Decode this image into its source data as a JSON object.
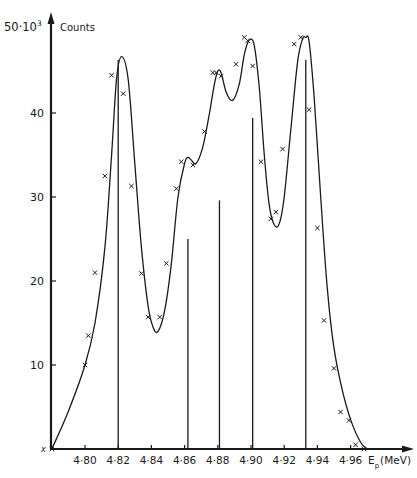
{
  "chart_data": {
    "type": "line",
    "title": "",
    "xlabel": "E_p (MeV)",
    "ylabel": "Counts",
    "y_unit_label": "50·10³",
    "xlim": [
      4.78,
      4.975
    ],
    "ylim": [
      0,
      50
    ],
    "x_ticks": [
      4.8,
      4.82,
      4.84,
      4.86,
      4.88,
      4.9,
      4.92,
      4.94,
      4.96
    ],
    "x_tick_labels": [
      "4·80",
      "4·82",
      "4·84",
      "4·86",
      "4·88",
      "4·90",
      "4·92",
      "4·94",
      "4·96"
    ],
    "y_ticks": [
      10,
      20,
      30,
      40
    ],
    "y_tick_labels": [
      "10",
      "20",
      "30",
      "40"
    ],
    "grid": false,
    "series": [
      {
        "name": "fitted curve",
        "style": "smooth line",
        "x": [
          4.78,
          4.79,
          4.8,
          4.806,
          4.812,
          4.816,
          4.819,
          4.822,
          4.826,
          4.83,
          4.834,
          4.838,
          4.841,
          4.844,
          4.848,
          4.852,
          4.856,
          4.86,
          4.862,
          4.864,
          4.867,
          4.871,
          4.875,
          4.878,
          4.88,
          4.882,
          4.885,
          4.889,
          4.893,
          4.896,
          4.899,
          4.902,
          4.905,
          4.908,
          4.911,
          4.914,
          4.917,
          4.92,
          4.924,
          4.928,
          4.931,
          4.933,
          4.935,
          4.938,
          4.942,
          4.946,
          4.95,
          4.955,
          4.96,
          4.966,
          4.97
        ],
        "y": [
          0,
          4.5,
          10,
          15,
          24,
          35,
          44,
          46.7,
          44,
          34,
          24,
          17,
          14.5,
          14,
          16.5,
          22,
          30,
          34,
          34.7,
          34.4,
          34,
          36,
          40,
          43.5,
          45,
          44.8,
          42.5,
          41.5,
          43.5,
          47,
          48.7,
          48,
          43,
          35,
          29,
          26.7,
          26.8,
          30,
          38,
          46,
          48.8,
          49,
          48.5,
          42,
          30,
          19,
          12,
          7,
          3.5,
          0.8,
          0
        ]
      },
      {
        "name": "measured points",
        "style": "x markers",
        "x": [
          4.78,
          4.8,
          4.802,
          4.806,
          4.812,
          4.816,
          4.823,
          4.828,
          4.834,
          4.838,
          4.845,
          4.849,
          4.855,
          4.858,
          4.865,
          4.872,
          4.877,
          4.879,
          4.882,
          4.891,
          4.896,
          4.898,
          4.901,
          4.906,
          4.912,
          4.915,
          4.919,
          4.926,
          4.93,
          4.935,
          4.94,
          4.944,
          4.95,
          4.954,
          4.959,
          4.963,
          4.968
        ],
        "y": [
          0,
          10,
          13.5,
          21,
          32.5,
          44.5,
          42.3,
          31.3,
          20.9,
          15.7,
          15.7,
          22.1,
          31,
          34.2,
          33.8,
          37.8,
          44.8,
          44.8,
          44.4,
          45.8,
          49,
          48.6,
          45.6,
          34.2,
          27.4,
          28.2,
          35.7,
          48.2,
          49,
          40.4,
          26.3,
          15.3,
          9.6,
          4.4,
          3.4,
          0.5,
          0
        ]
      },
      {
        "name": "line positions",
        "style": "vertical bars",
        "x": [
          4.82,
          4.862,
          4.881,
          4.901,
          4.933
        ],
        "y": [
          46.3,
          25.0,
          29.6,
          39.4,
          46.3
        ]
      }
    ],
    "annotations": []
  },
  "axis": {
    "y_label": "Counts",
    "y_scale_label": "50·10",
    "y_scale_exp": "3",
    "x_label_main": "E",
    "x_label_sub": "p",
    "x_label_unit": "(MeV)",
    "origin_marker": "x"
  },
  "colors": {
    "ink": "#1a1a1a",
    "background": "#ffffff"
  }
}
